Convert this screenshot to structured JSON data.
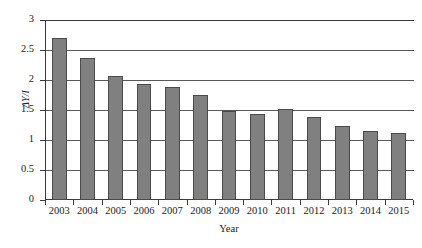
{
  "chart_data": {
    "type": "bar",
    "title": "",
    "subtitle": "",
    "xlabel": "Year",
    "ylabel": "ΔY/I",
    "categories": [
      "2003",
      "2004",
      "2005",
      "2006",
      "2007",
      "2008",
      "2009",
      "2010",
      "2011",
      "2012",
      "2013",
      "2014",
      "2015"
    ],
    "values": [
      2.7,
      2.36,
      2.07,
      1.94,
      1.88,
      1.75,
      1.48,
      1.44,
      1.52,
      1.38,
      1.24,
      1.15,
      1.11
    ],
    "ylim": [
      0,
      3
    ],
    "yticks": [
      0,
      0.5,
      1,
      1.5,
      2,
      2.5,
      3
    ],
    "ytick_labels": [
      "0",
      "0.5",
      "1",
      "1.5",
      "2",
      "2.5",
      "3"
    ],
    "grid": true,
    "grid_axis": "y",
    "legend": false,
    "legend_position": "none",
    "bar_color": "#808080",
    "bar_edge_color": "#4a4a4a",
    "axis_color": "#3a3a3a",
    "grid_color": "#595959",
    "background_color": "#ffffff"
  }
}
